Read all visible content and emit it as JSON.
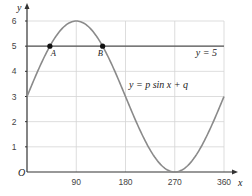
{
  "chart_data": {
    "type": "line",
    "title": "",
    "xlabel": "x",
    "ylabel": "y",
    "origin_label": "O",
    "xlim": [
      0,
      360
    ],
    "ylim": [
      0,
      7
    ],
    "grid": true,
    "x_ticks": [
      90,
      180,
      270,
      360
    ],
    "x_tick_labels": [
      "90",
      "180",
      "270",
      "360"
    ],
    "y_ticks": [
      1,
      2,
      3,
      4,
      5,
      6
    ],
    "y_tick_labels": [
      "1",
      "2",
      "3",
      "4",
      "5",
      "6",
      "7"
    ],
    "series": [
      {
        "name": "y=psinx+q",
        "label": "y = p sin x + q",
        "function": "3*sin(x)+3",
        "p": 3,
        "q": 3,
        "x": [
          0,
          30,
          60,
          90,
          120,
          150,
          180,
          210,
          240,
          270,
          300,
          330,
          360
        ],
        "y": [
          3,
          4.5,
          5.6,
          6,
          5.6,
          4.5,
          3,
          1.5,
          0.4,
          0,
          0.4,
          1.5,
          3
        ],
        "color": "#888888"
      },
      {
        "name": "y=5",
        "label": "y = 5",
        "x": [
          0,
          360
        ],
        "y": [
          5,
          5
        ],
        "color": "#555555"
      }
    ],
    "points": [
      {
        "label": "A",
        "x": 41.8,
        "y": 5
      },
      {
        "label": "B",
        "x": 138.2,
        "y": 5
      }
    ],
    "annotations": [
      {
        "text": "y = 5",
        "near": "horizontal line, right end"
      },
      {
        "text": "y = p sin x + q",
        "near": "curve, descending section"
      }
    ]
  },
  "labels": {
    "y_axis": "y",
    "x_axis": "x",
    "origin": "O",
    "line_label": "y = 5",
    "curve_label": "y = p sin x + q",
    "point_a": "A",
    "point_b": "B"
  }
}
